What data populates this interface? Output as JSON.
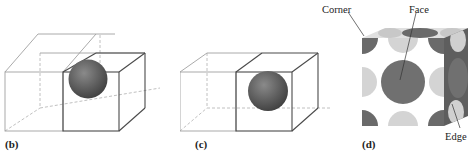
{
  "figure": {
    "panels": [
      {
        "id": "b",
        "label": "(b)",
        "description": "two adjacent unit cells with a sphere at the shared face"
      },
      {
        "id": "c",
        "label": "(c)",
        "description": "two adjacent unit cells with a sphere at the shared face"
      },
      {
        "id": "d",
        "label": "(d)",
        "description": "space-filling unit cell showing atom positions"
      }
    ],
    "callouts": {
      "corner": "Corner",
      "face": "Face",
      "edge": "Edge"
    },
    "colors": {
      "line": "#9a9a9a",
      "line_dark": "#4a4a4a",
      "sphere": "#6f6f6f",
      "atom_dark": "#6a6a6a",
      "atom_light": "#d4d4d4"
    }
  }
}
